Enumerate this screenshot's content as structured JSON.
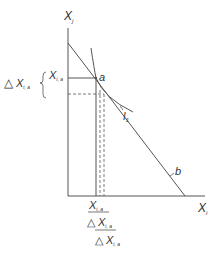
{
  "diagram": {
    "colors": {
      "line": "#555555",
      "text": "#333333",
      "background": "#ffffff"
    },
    "axes": {
      "y_label": "X",
      "y_sub": "j",
      "x_label": "X",
      "x_sub": "i"
    },
    "curves": {
      "budget_line_label": "b",
      "indifference_label": "I",
      "indifference_sub": "1"
    },
    "point": {
      "label": "a"
    },
    "y_annotations": {
      "level_label": "X",
      "level_sub": "i, a",
      "delta_symbol": "△",
      "delta_label": "X",
      "delta_sub": "i, a"
    },
    "x_annotations": {
      "level_label": "X",
      "level_sub": "i, a",
      "delta1_symbol": "△",
      "delta1_label": "X",
      "delta1_sub": "i, a",
      "delta2_symbol": "△",
      "delta2_label": "X",
      "delta2_sub": "i, a"
    }
  }
}
